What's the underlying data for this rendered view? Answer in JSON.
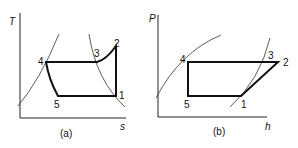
{
  "diagrams": [
    {
      "id": "a",
      "caption": "(a)",
      "y_axis": "T",
      "x_axis": "s",
      "points": {
        "p1": "1",
        "p2": "2",
        "p3": "3",
        "p4": "4",
        "p5": "5"
      }
    },
    {
      "id": "b",
      "caption": "(b)",
      "y_axis": "P",
      "x_axis": "h",
      "points": {
        "p1": "1",
        "p2": "2",
        "p3": "3",
        "p4": "4",
        "p5": "5"
      }
    }
  ],
  "colors": {
    "line": "#111111",
    "background": "#ffffff"
  }
}
